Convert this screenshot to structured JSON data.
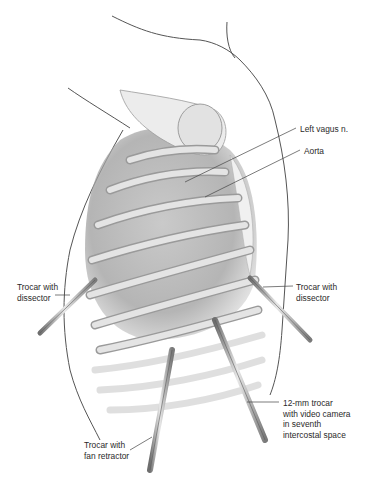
{
  "figure": {
    "colors": {
      "background": "#ffffff",
      "outline": "#555555",
      "rib": "#d8d8d8",
      "shadow": "#8a8a8a",
      "instrument": "#9a9a9a",
      "text": "#2a2a2a",
      "leader": "#444444"
    }
  },
  "labels": [
    {
      "id": "left-vagus",
      "text": "Left vagus n.",
      "x": 300,
      "y": 124
    },
    {
      "id": "aorta",
      "text": "Aorta",
      "x": 304,
      "y": 146
    },
    {
      "id": "trocar-dissector-left",
      "text": "Trocar with\ndissector",
      "x": 17,
      "y": 282
    },
    {
      "id": "trocar-dissector-right",
      "text": "Trocar with\ndissector",
      "x": 296,
      "y": 282
    },
    {
      "id": "trocar-camera",
      "text": "12-mm trocar\nwith video camera\nin seventh\nintercostal space",
      "x": 283,
      "y": 398
    },
    {
      "id": "trocar-fan-retractor",
      "text": "Trocar with\nfan retractor",
      "x": 84,
      "y": 440
    }
  ]
}
